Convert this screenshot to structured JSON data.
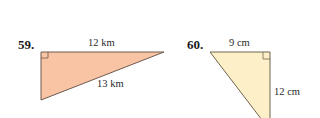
{
  "problems": [
    {
      "number": "59.",
      "fill_color": "#f8c4a4",
      "stroke_color": "#6e5a50",
      "labels": {
        "top": "12 km",
        "hypotenuse": "13 km"
      },
      "right_angle": "top-left"
    },
    {
      "number": "60.",
      "fill_color": "#fdf0c8",
      "stroke_color": "#6e6450",
      "labels": {
        "top": "9 cm",
        "right": "12 cm"
      },
      "right_angle": "top-right"
    }
  ]
}
